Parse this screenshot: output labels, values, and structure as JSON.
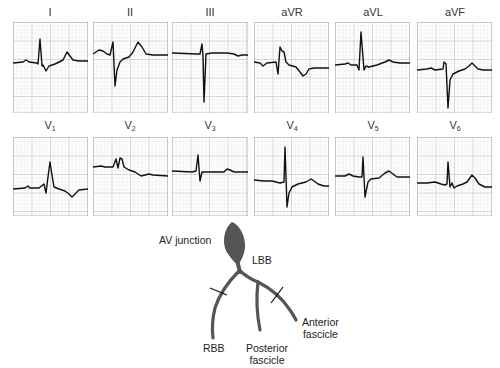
{
  "figure": {
    "grid_color": "#b8b8b8",
    "trace_color": "#111111",
    "conduction_color": "#555555"
  },
  "leads": [
    {
      "id": "I",
      "label": "I",
      "sub": "",
      "row": 0,
      "col": 0
    },
    {
      "id": "II",
      "label": "II",
      "sub": "",
      "row": 0,
      "col": 1
    },
    {
      "id": "III",
      "label": "III",
      "sub": "",
      "row": 0,
      "col": 2
    },
    {
      "id": "aVR",
      "label": "aVR",
      "sub": "",
      "row": 0,
      "col": 3
    },
    {
      "id": "aVL",
      "label": "aVL",
      "sub": "",
      "row": 0,
      "col": 4
    },
    {
      "id": "aVF",
      "label": "aVF",
      "sub": "",
      "row": 0,
      "col": 5
    },
    {
      "id": "V1",
      "label": "V",
      "sub": "1",
      "row": 1,
      "col": 0
    },
    {
      "id": "V2",
      "label": "V",
      "sub": "2",
      "row": 1,
      "col": 1
    },
    {
      "id": "V3",
      "label": "V",
      "sub": "3",
      "row": 1,
      "col": 2
    },
    {
      "id": "V4",
      "label": "V",
      "sub": "4",
      "row": 1,
      "col": 3
    },
    {
      "id": "V5",
      "label": "V",
      "sub": "5",
      "row": 1,
      "col": 4
    },
    {
      "id": "V6",
      "label": "V",
      "sub": "6",
      "row": 1,
      "col": 5
    }
  ],
  "diagram": {
    "av_junction": "AV junction",
    "lbb": "LBB",
    "rbb": "RBB",
    "posterior_1": "Posterior",
    "posterior_2": "fascicle",
    "anterior_1": "Anterior",
    "anterior_2": "fascicle",
    "blocked_branches": [
      "RBB",
      "Anterior fascicle"
    ]
  }
}
